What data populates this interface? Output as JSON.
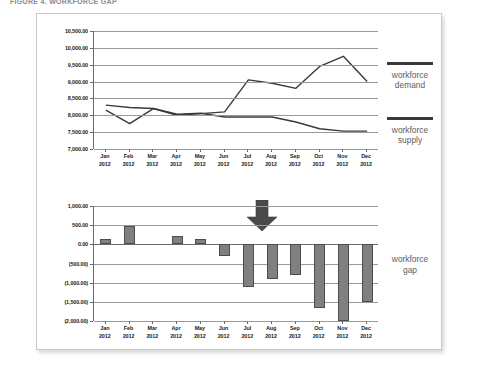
{
  "figure": {
    "title": "FIGURE 4. WORKFORCE GAP"
  },
  "legend": {
    "demand": "workforce\ndemand",
    "demand_line1": "workforce",
    "demand_line2": "demand",
    "supply_line1": "workforce",
    "supply_line2": "supply",
    "gap_line1": "workforce",
    "gap_line2": "gap"
  },
  "colors": {
    "line": "#3a3a3a",
    "bar_fill": "#808080",
    "bar_stroke": "#4d4d4d",
    "grid": "#9a9a9a",
    "axis": "#6b6b6b",
    "legend_text": "#5c5c5c",
    "frame_border": "#c9c9c9"
  },
  "chart_data": [
    {
      "type": "line",
      "title": "",
      "xlabel": "",
      "ylabel": "",
      "grid": true,
      "legend_position": "right",
      "categories": [
        "Jan 2012",
        "Feb 2012",
        "Mar 2012",
        "Apr 2012",
        "May 2012",
        "Jun 2012",
        "Jul 2012",
        "Aug 2012",
        "Sep 2012",
        "Oct 2012",
        "Nov 2012",
        "Dec 2012"
      ],
      "x_tick_labels_line1": [
        "Jan",
        "Feb",
        "Mar",
        "Apr",
        "May",
        "Jun",
        "Jul",
        "Aug",
        "Sep",
        "Oct",
        "Nov",
        "Dec"
      ],
      "x_tick_labels_line2": [
        "2012",
        "2012",
        "2012",
        "2012",
        "2012",
        "2012",
        "2012",
        "2012",
        "2012",
        "2012",
        "2012",
        "2012"
      ],
      "y_tick_labels": [
        "10,500.00",
        "10,000.00",
        "9,500.00",
        "9,000.00",
        "8,500.00",
        "8,000.00",
        "7,500.00",
        "7,000.00"
      ],
      "y_tick_values": [
        10500,
        10000,
        9500,
        9000,
        8500,
        8000,
        7500,
        7000
      ],
      "ylim": [
        7000,
        10500
      ],
      "series": [
        {
          "name": "workforce demand",
          "values": [
            8150,
            7750,
            8200,
            8000,
            8050,
            8100,
            9050,
            8950,
            8800,
            9450,
            9750,
            9000
          ]
        },
        {
          "name": "workforce supply",
          "values": [
            8300,
            8230,
            8200,
            8030,
            8060,
            7950,
            7950,
            7950,
            7800,
            7600,
            7530,
            7530
          ]
        }
      ]
    },
    {
      "type": "bar",
      "title": "",
      "xlabel": "",
      "ylabel": "",
      "grid": true,
      "legend_position": "right",
      "categories": [
        "Jan 2012",
        "Feb 2012",
        "Mar 2012",
        "Apr 2012",
        "May 2012",
        "Jun 2012",
        "Jul 2012",
        "Aug 2012",
        "Sep 2012",
        "Oct 2012",
        "Nov 2012",
        "Dec 2012"
      ],
      "x_tick_labels_line1": [
        "Jan",
        "Feb",
        "Mar",
        "Apr",
        "May",
        "Jun",
        "Jul",
        "Aug",
        "Sep",
        "Oct",
        "Nov",
        "Dec"
      ],
      "x_tick_labels_line2": [
        "2012",
        "2012",
        "2012",
        "2012",
        "2012",
        "2012",
        "2012",
        "2012",
        "2012",
        "2012",
        "2012",
        "2012"
      ],
      "y_tick_labels": [
        "1,000.00",
        "500.00",
        "0.00",
        "(500.00)",
        "(1,000.00)",
        "(1,500.00)",
        "(2,000.00)"
      ],
      "y_tick_values": [
        1000,
        500,
        0,
        -500,
        -1000,
        -1500,
        -2000
      ],
      "ylim": [
        -2000,
        1000
      ],
      "series": [
        {
          "name": "workforce gap",
          "values": [
            150,
            480,
            0,
            230,
            150,
            -310,
            -1120,
            -900,
            -810,
            -1660,
            -2000,
            -1500
          ]
        }
      ]
    }
  ]
}
